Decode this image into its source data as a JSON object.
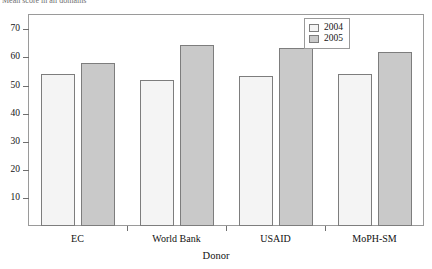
{
  "caption": {
    "text": "Mean score in all domains"
  },
  "legend": {
    "position": "top-right",
    "entries": [
      {
        "label": "2004",
        "color": "#f4f4f4"
      },
      {
        "label": "2005",
        "color": "#c9c9c9"
      }
    ]
  },
  "axes": {
    "x_title": "Donor",
    "y_title": "",
    "y_ticks": [
      10,
      20,
      30,
      40,
      50,
      60,
      70
    ]
  },
  "chart_data": {
    "type": "bar",
    "title": "Mean score in all domains",
    "xlabel": "Donor",
    "ylabel": "",
    "categories": [
      "EC",
      "World Bank",
      "USAID",
      "MoPH-SM"
    ],
    "series": [
      {
        "name": "2004",
        "color": "#f4f4f4",
        "values": [
          54,
          52,
          53.5,
          54
        ]
      },
      {
        "name": "2005",
        "color": "#c9c9c9",
        "values": [
          58,
          64.5,
          63.5,
          62
        ]
      }
    ],
    "ylim": [
      0,
      75
    ],
    "yticks": [
      10,
      20,
      30,
      40,
      50,
      60,
      70
    ],
    "grid": false,
    "legend_position": "top-right"
  }
}
